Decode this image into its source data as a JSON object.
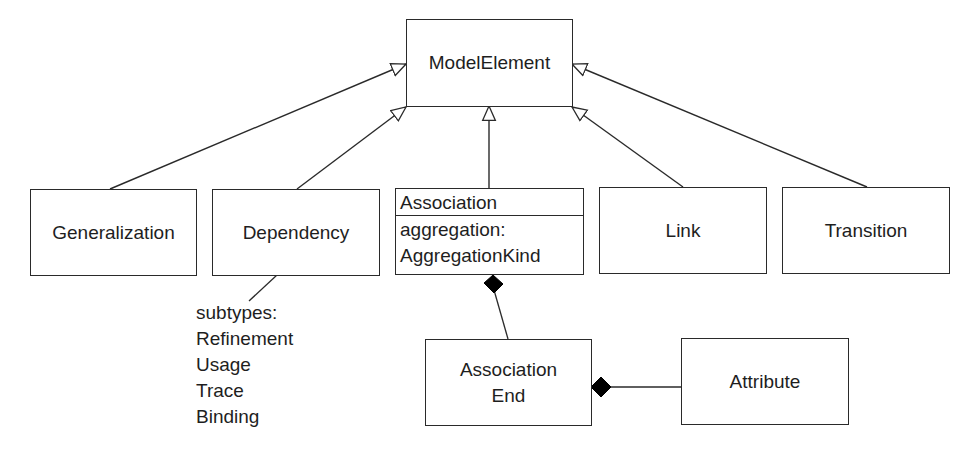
{
  "diagram": {
    "type": "UML class diagram",
    "classes": {
      "model_element": {
        "name": "ModelElement"
      },
      "generalization": {
        "name": "Generalization"
      },
      "dependency": {
        "name": "Dependency"
      },
      "association": {
        "name": "Association",
        "attributes": [
          "aggregation:",
          "AggregationKind"
        ]
      },
      "link": {
        "name": "Link"
      },
      "transition": {
        "name": "Transition"
      },
      "association_end": {
        "name_lines": [
          "Association",
          "End"
        ]
      },
      "attribute": {
        "name": "Attribute"
      }
    },
    "dependency_note": {
      "lines": [
        "subtypes:",
        "Refinement",
        "Usage",
        "Trace",
        "Binding"
      ]
    },
    "relationships": [
      {
        "kind": "generalization",
        "from": "Generalization",
        "to": "ModelElement"
      },
      {
        "kind": "generalization",
        "from": "Dependency",
        "to": "ModelElement"
      },
      {
        "kind": "generalization",
        "from": "Association",
        "to": "ModelElement"
      },
      {
        "kind": "generalization",
        "from": "Link",
        "to": "ModelElement"
      },
      {
        "kind": "generalization",
        "from": "Transition",
        "to": "ModelElement"
      },
      {
        "kind": "composition",
        "whole": "Association",
        "part": "Association End"
      },
      {
        "kind": "composition",
        "whole": "Association End",
        "part": "Attribute"
      },
      {
        "kind": "note-anchor",
        "from": "Dependency",
        "to": "subtypes note"
      }
    ],
    "colors": {
      "line": "#2a2a2a",
      "background": "#ffffff",
      "diamond_fill": "#000000"
    }
  }
}
